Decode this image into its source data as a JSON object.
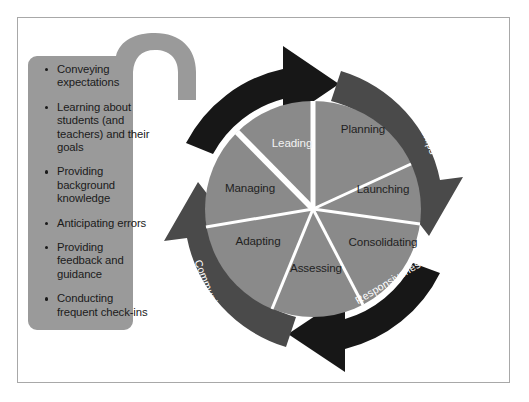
{
  "figure": {
    "callout": {
      "bullets": [
        "Conveying expectations",
        "Learning about students (and teachers) and their goals",
        "Providing background knowledge",
        "Anticipating errors",
        "Providing feedback and guidance",
        "Conducting frequent check-ins"
      ]
    },
    "wheel": {
      "segments": [
        {
          "label": "Planning"
        },
        {
          "label": "Launching"
        },
        {
          "label": "Consolidating"
        },
        {
          "label": "Assessing"
        },
        {
          "label": "Adapting"
        },
        {
          "label": "Managing"
        },
        {
          "label": "Leading"
        }
      ]
    },
    "ring": {
      "arrows": [
        {
          "label": "Sustainability"
        },
        {
          "label": "Relationships"
        },
        {
          "label": "Responsiveness"
        },
        {
          "label": "Communication"
        }
      ]
    },
    "colors": {
      "frame_border": "#a8a8a8",
      "callout_fill": "#9a9a9a",
      "wheel_fill": "#8a8a8a",
      "spoke": "#ffffff",
      "arrow_dark": "#171717",
      "arrow_mid": "#4a4a4a",
      "label_dark": "#1f1f1f",
      "label_light": "#f2f2f2",
      "page_background": "#ffffff"
    }
  }
}
